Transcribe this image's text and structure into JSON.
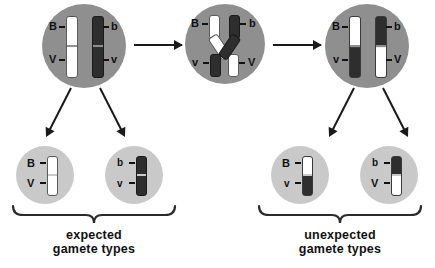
{
  "diagram": {
    "colors": {
      "background": "#ffffff",
      "cell": "#8f8f8f",
      "gamete_cell": "#c9c9c9",
      "chromosome_white": "#ffffff",
      "chromosome_dark": "#2e2e2e",
      "ink": "#1a1a1a"
    }
  },
  "meiosis_cells": [
    {
      "id": "cell-parental",
      "stage": "pre-crossover",
      "chromosomes": [
        {
          "id": "chrom-white-BV",
          "shade": "white",
          "top_allele": "B",
          "bottom_allele": "V"
        },
        {
          "id": "chrom-dark-bv",
          "shade": "dark",
          "top_allele": "b",
          "bottom_allele": "v"
        }
      ]
    },
    {
      "id": "cell-crossover",
      "stage": "crossing-over",
      "chromosomes": [
        {
          "id": "chiasma-white",
          "shade": "white",
          "top_allele": "B",
          "bottom_allele": "V"
        },
        {
          "id": "chiasma-dark",
          "shade": "dark",
          "top_allele": "b",
          "bottom_allele": "v"
        }
      ]
    },
    {
      "id": "cell-recombinant",
      "stage": "post-crossover",
      "chromosomes": [
        {
          "id": "chrom-recomb-Bv",
          "shade": "white-over-dark",
          "top_allele": "B",
          "bottom_allele": "v"
        },
        {
          "id": "chrom-recomb-bV",
          "shade": "dark-over-white",
          "top_allele": "b",
          "bottom_allele": "V"
        }
      ]
    }
  ],
  "gametes": [
    {
      "id": "gamete-BV",
      "shade": "white",
      "top_allele": "B",
      "bottom_allele": "V",
      "group": "expected"
    },
    {
      "id": "gamete-bv",
      "shade": "dark",
      "top_allele": "b",
      "bottom_allele": "v",
      "group": "expected"
    },
    {
      "id": "gamete-Bv",
      "shade": "white-over-dark",
      "top_allele": "B",
      "bottom_allele": "v",
      "group": "unexpected"
    },
    {
      "id": "gamete-bV",
      "shade": "dark-over-white",
      "top_allele": "b",
      "bottom_allele": "V",
      "group": "unexpected"
    }
  ],
  "captions": {
    "expected_line1": "expected",
    "expected_line2": "gamete types",
    "unexpected_line1": "unexpected",
    "unexpected_line2": "gamete types"
  }
}
